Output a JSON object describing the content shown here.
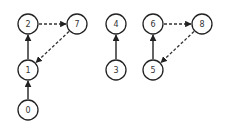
{
  "diagram": {
    "type": "directed-graph",
    "nodes": [
      {
        "id": "0",
        "label": "0",
        "x": 28,
        "y": 110
      },
      {
        "id": "1",
        "label": "1",
        "x": 28,
        "y": 70
      },
      {
        "id": "2",
        "label": "2",
        "x": 28,
        "y": 24
      },
      {
        "id": "7",
        "label": "7",
        "x": 77,
        "y": 24
      },
      {
        "id": "3",
        "label": "3",
        "x": 116,
        "y": 70
      },
      {
        "id": "4",
        "label": "4",
        "x": 116,
        "y": 24
      },
      {
        "id": "5",
        "label": "5",
        "x": 153,
        "y": 70
      },
      {
        "id": "6",
        "label": "6",
        "x": 153,
        "y": 24
      },
      {
        "id": "8",
        "label": "8",
        "x": 202,
        "y": 24
      }
    ],
    "edges": [
      {
        "from": "0",
        "to": "1",
        "style": "solid"
      },
      {
        "from": "1",
        "to": "2",
        "style": "solid"
      },
      {
        "from": "2",
        "to": "7",
        "style": "dashed"
      },
      {
        "from": "7",
        "to": "1",
        "style": "dashed"
      },
      {
        "from": "3",
        "to": "4",
        "style": "solid"
      },
      {
        "from": "5",
        "to": "6",
        "style": "solid"
      },
      {
        "from": "6",
        "to": "8",
        "style": "dashed"
      },
      {
        "from": "8",
        "to": "5",
        "style": "dashed"
      }
    ],
    "node_radius": 10,
    "colors": {
      "stroke": "#222222",
      "fill": "#ffffff",
      "text": "#333333"
    }
  }
}
